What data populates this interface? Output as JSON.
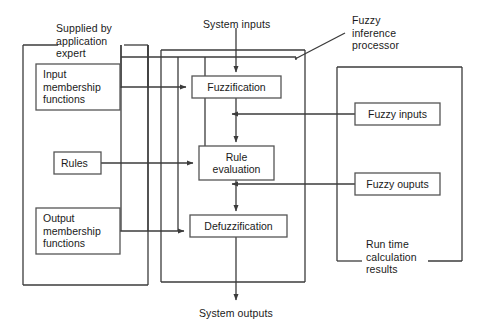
{
  "diagram": {
    "colors": {
      "stroke": "#3b3b3b",
      "box_stroke": "#555555",
      "background": "#ffffff",
      "text": "#1a1a1a"
    },
    "groups": [
      {
        "id": "supplied-by-application-expert",
        "label": "Supplied by\napplication\nexpert",
        "x": 23,
        "y": 45,
        "width": 125,
        "height": 240,
        "label_x": 44,
        "label_y": 6
      },
      {
        "id": "fuzzy-inference-processor",
        "label": "Fuzzy\ninference\nprocessor",
        "x": 161,
        "y": 50,
        "width": 144,
        "height": 232,
        "label_x": 389,
        "label_y": 14
      },
      {
        "id": "run-time-calculation-results",
        "label": "Run time\ncalculation\nresults",
        "x": 337,
        "y": 67,
        "width": 125,
        "height": 194,
        "label_x": 366,
        "label_y": 238
      }
    ],
    "boxes": [
      {
        "id": "input-membership-functions",
        "label": "Input\nmembership\nfunctions",
        "x": 36,
        "y": 64,
        "width": 84,
        "height": 46,
        "align": "left"
      },
      {
        "id": "rules",
        "label": "Rules",
        "x": 54,
        "y": 152,
        "width": 47,
        "height": 22,
        "align": "left"
      },
      {
        "id": "output-membership-functions",
        "label": "Output\nmembership\nfunctions",
        "x": 36,
        "y": 208,
        "width": 84,
        "height": 46,
        "align": "left"
      },
      {
        "id": "fuzzification",
        "label": "Fuzzification",
        "x": 192,
        "y": 76,
        "width": 89,
        "height": 22,
        "align": "center"
      },
      {
        "id": "rule-evaluation",
        "label": "Rule\nevaluation",
        "x": 199,
        "y": 146,
        "width": 75,
        "height": 34,
        "align": "center"
      },
      {
        "id": "defuzzification",
        "label": "Defuzzification",
        "x": 190,
        "y": 215,
        "width": 97,
        "height": 22,
        "align": "center"
      },
      {
        "id": "fuzzy-inputs",
        "label": "Fuzzy inputs",
        "x": 355,
        "y": 103,
        "width": 85,
        "height": 22,
        "align": "center"
      },
      {
        "id": "fuzzy-ouputs",
        "label": "Fuzzy ouputs",
        "x": 355,
        "y": 173,
        "width": 85,
        "height": 22,
        "align": "center"
      }
    ],
    "flow_labels": [
      {
        "id": "system-inputs",
        "label": "System inputs",
        "x": 203,
        "y": 18
      },
      {
        "id": "system-outputs",
        "label": "System outputs",
        "x": 199,
        "y": 313
      }
    ]
  }
}
